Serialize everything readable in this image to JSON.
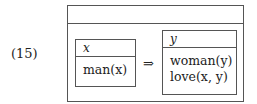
{
  "example_number": "(15)",
  "outer_box": {
    "universe": "",
    "conditions": []
  },
  "antecedent": {
    "universe": "x",
    "conditions": [
      "man(x)"
    ]
  },
  "operator": "⇒",
  "consequent": {
    "universe": "y",
    "conditions": [
      "woman(y)",
      "love(x, y)"
    ]
  }
}
